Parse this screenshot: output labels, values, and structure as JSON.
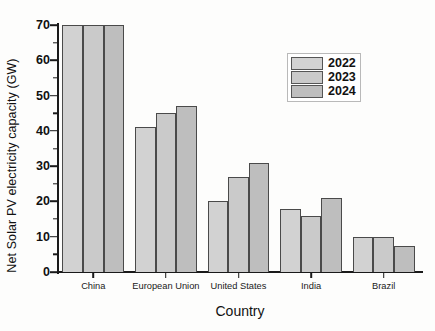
{
  "chart_data": {
    "type": "bar",
    "title": "",
    "xlabel": "Country",
    "ylabel": "Net Solar PV electricity capacity (GW)",
    "categories": [
      "China",
      "European Union",
      "United States",
      "India",
      "Brazil"
    ],
    "series": [
      {
        "name": "2022",
        "values": [
          70,
          41,
          20,
          18,
          10
        ],
        "color": "#d2d2d2"
      },
      {
        "name": "2023",
        "values": [
          70,
          45,
          27,
          16,
          10
        ],
        "color": "#cacaca"
      },
      {
        "name": "2024",
        "values": [
          70,
          47,
          31,
          21,
          7.5
        ],
        "color": "#bebebe"
      }
    ],
    "ylim": [
      0,
      70
    ],
    "ytick_labels": [
      "0",
      "10",
      "20",
      "30",
      "40",
      "50",
      "60",
      "70"
    ],
    "ytick_values": [
      0,
      10,
      20,
      30,
      40,
      50,
      60,
      70
    ],
    "yminor_values": [
      5,
      15,
      25,
      35,
      45,
      55,
      65
    ],
    "grid": "off",
    "legend_position": "upper right"
  },
  "axis_style": {
    "line_color": "#1a1a1a",
    "bar_edge_color": "#4a4a4a"
  }
}
